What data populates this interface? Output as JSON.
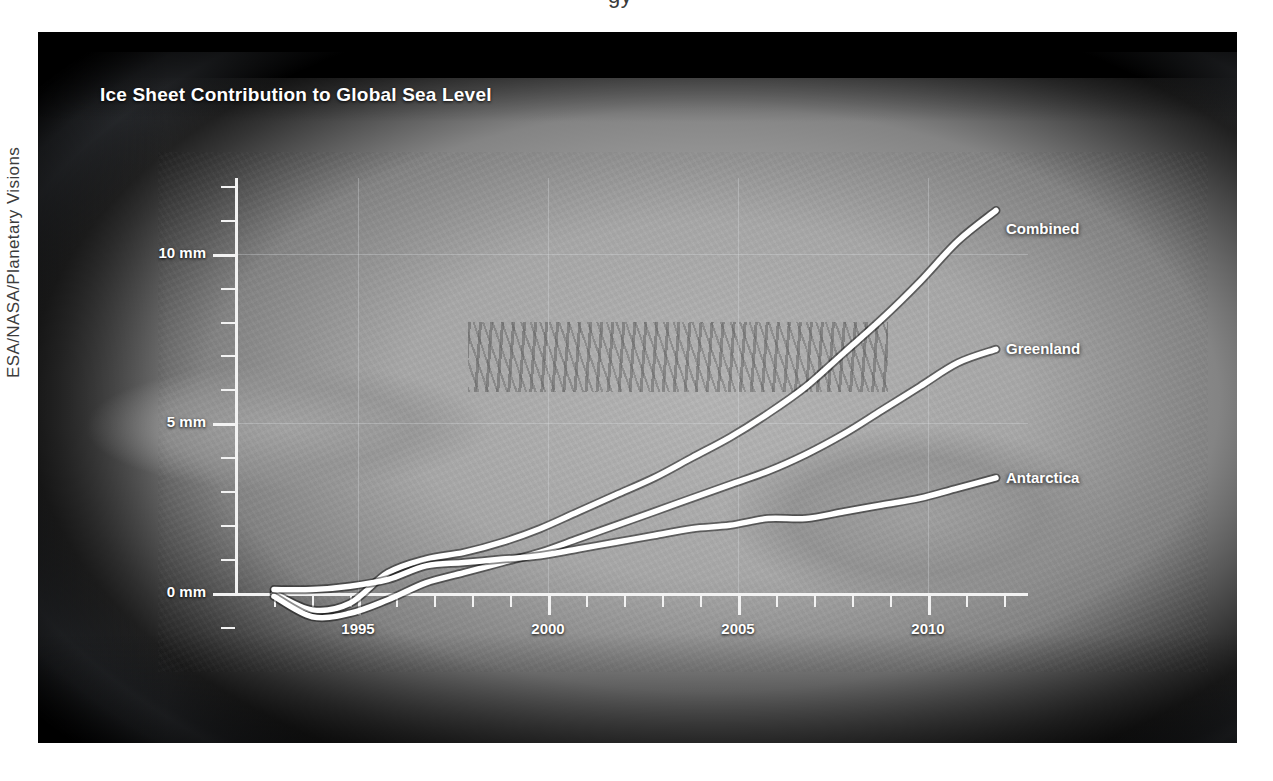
{
  "credit": "ESA/NASA/Planetary Visions",
  "top_partial_glyph": "gy",
  "figure": {
    "title": "Ice Sheet Contribution to Global Sea Level",
    "background_color": "#000000",
    "background_image_description": "greyscale satellite view of the Antarctic ice sheet",
    "line_color": "#ffffff",
    "text_color": "#ffffff",
    "grid_color": "#e1e4e8"
  },
  "axes": {
    "y_labels": [
      "0 mm",
      "5 mm",
      "10 mm"
    ],
    "y_values": [
      0,
      5,
      10
    ],
    "x_labels": [
      "1995",
      "2000",
      "2005",
      "2010"
    ],
    "x_values": [
      1995,
      2000,
      2005,
      2010
    ]
  },
  "series_labels": {
    "combined": "Combined",
    "greenland": "Greenland",
    "antarctica": "Antarctica"
  },
  "chart_data": {
    "type": "line",
    "title": "Ice Sheet Contribution to Global Sea Level",
    "xlabel": "",
    "ylabel": "mm",
    "xlim": [
      1991,
      2011
    ],
    "ylim": [
      -1.5,
      12.3
    ],
    "y_ticks": [
      0,
      5,
      10
    ],
    "y_tick_labels": [
      "0 mm",
      "5 mm",
      "10 mm"
    ],
    "y_minor_tick_step": 1,
    "x_ticks": [
      1995,
      2000,
      2005,
      2010
    ],
    "x_minor_tick_step": 1,
    "grid": "major gridlines, faint",
    "legend": "inline labels at right end of each line",
    "units": "mm of global sea level equivalent",
    "x": [
      1992,
      1993,
      1994,
      1995,
      1996,
      1997,
      1998,
      1999,
      2000,
      2001,
      2002,
      2003,
      2004,
      2005,
      2006,
      2007,
      2008,
      2009,
      2010,
      2011
    ],
    "series": [
      {
        "name": "Combined",
        "values": [
          0.0,
          -0.5,
          -0.3,
          0.6,
          1.0,
          1.2,
          1.5,
          1.9,
          2.4,
          2.9,
          3.4,
          4.0,
          4.6,
          5.3,
          6.1,
          7.1,
          8.1,
          9.2,
          10.4,
          11.3
        ]
      },
      {
        "name": "Greenland",
        "values": [
          -0.1,
          -0.7,
          -0.6,
          -0.2,
          0.3,
          0.6,
          0.9,
          1.2,
          1.6,
          2.0,
          2.4,
          2.8,
          3.2,
          3.6,
          4.1,
          4.7,
          5.4,
          6.1,
          6.8,
          7.2
        ]
      },
      {
        "name": "Antarctica",
        "values": [
          0.1,
          0.1,
          0.2,
          0.4,
          0.8,
          0.9,
          1.0,
          1.1,
          1.3,
          1.5,
          1.7,
          1.9,
          2.0,
          2.2,
          2.2,
          2.4,
          2.6,
          2.8,
          3.1,
          3.4
        ]
      }
    ]
  }
}
